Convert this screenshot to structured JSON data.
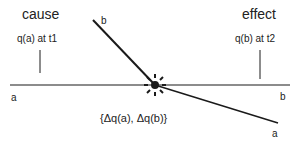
{
  "diagram": {
    "cause_label": "cause",
    "effect_label": "effect",
    "cause_quantity": "q(a) at t1",
    "effect_quantity": "q(b) at t2",
    "line_a_start_label": "a",
    "line_a_end_label": "a",
    "line_b_start_label": "b",
    "line_b_end_label": "b",
    "exchange_label": "{Δq(a), Δq(b)}",
    "colors": {
      "line": "#1a1a1a",
      "text": "#222222"
    }
  }
}
